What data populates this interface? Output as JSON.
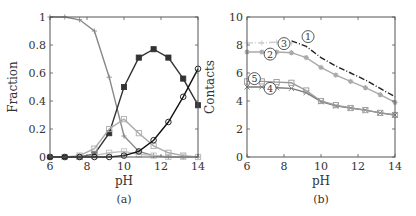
{
  "chart_data": [
    {
      "panel": "(a)",
      "type": "line",
      "xlabel": "pH",
      "ylabel": "Fraction",
      "xlim": [
        6,
        14
      ],
      "ylim": [
        0,
        1
      ],
      "xticks": [
        6,
        8,
        10,
        12,
        14
      ],
      "yticks": [
        0,
        0.2,
        0.4,
        0.6,
        0.8,
        1
      ],
      "ytick_labels": [
        "0",
        "0.2",
        "0.4",
        "0.6",
        "0.8",
        "1"
      ],
      "grid": false,
      "x": [
        6,
        6.8,
        7.6,
        8.4,
        9.2,
        10,
        10.8,
        11.6,
        12.4,
        13.2,
        14
      ],
      "series": [
        {
          "name": "plus-gray",
          "color": "#888888",
          "marker": "+",
          "values": [
            1.0,
            1.0,
            0.98,
            0.9,
            0.57,
            0.15,
            0.04,
            0.01,
            0.0,
            0.0,
            0.0
          ]
        },
        {
          "name": "filled-square-dark",
          "color": "#333333",
          "marker": "filled-square",
          "values": [
            0.0,
            0.0,
            0.0,
            0.02,
            0.17,
            0.5,
            0.71,
            0.77,
            0.71,
            0.56,
            0.37
          ]
        },
        {
          "name": "open-square-light",
          "color": "#aaaaaa",
          "marker": "open-square",
          "values": [
            0.0,
            0.0,
            0.01,
            0.06,
            0.2,
            0.27,
            0.17,
            0.08,
            0.03,
            0.01,
            0.0
          ]
        },
        {
          "name": "open-square-pale",
          "color": "#c0c0c0",
          "marker": "open-square",
          "values": [
            0.0,
            0.0,
            0.0,
            0.01,
            0.03,
            0.04,
            0.02,
            0.01,
            0.0,
            0.0,
            0.0
          ]
        },
        {
          "name": "circle-black",
          "color": "#111111",
          "marker": "open-circle",
          "values": [
            0.0,
            0.0,
            0.0,
            0.0,
            0.0,
            0.01,
            0.04,
            0.12,
            0.25,
            0.43,
            0.63
          ]
        }
      ]
    },
    {
      "panel": "(b)",
      "type": "line",
      "xlabel": "pH",
      "ylabel": "Contacts",
      "xlim": [
        6,
        14
      ],
      "ylim": [
        0,
        10
      ],
      "xticks": [
        6,
        8,
        10,
        12,
        14
      ],
      "yticks": [
        0,
        2,
        4,
        6,
        8,
        10
      ],
      "grid": false,
      "x": [
        6,
        6.8,
        7.6,
        8.4,
        9.2,
        10,
        10.8,
        11.6,
        12.4,
        13.2,
        14
      ],
      "series": [
        {
          "name": "1",
          "color": "#222222",
          "marker": "none",
          "dashed": true,
          "values": [
            null,
            null,
            null,
            8.3,
            7.9,
            7.1,
            6.5,
            6.0,
            5.5,
            4.9,
            4.3
          ]
        },
        {
          "name": "2",
          "color": "#aaaaaa",
          "marker": "star",
          "values": [
            7.5,
            7.5,
            7.5,
            7.45,
            7.1,
            6.4,
            5.85,
            5.4,
            4.95,
            4.45,
            3.9
          ]
        },
        {
          "name": "3",
          "color": "#cccccc",
          "marker": "plus",
          "dashed": true,
          "values": [
            8.15,
            8.15,
            8.2,
            8.15,
            null,
            null,
            null,
            null,
            null,
            null,
            null
          ]
        },
        {
          "name": "4",
          "color": "#777777",
          "marker": "x",
          "values": [
            5.0,
            5.0,
            4.95,
            4.9,
            4.6,
            3.95,
            3.65,
            3.5,
            3.35,
            3.15,
            3.0
          ]
        },
        {
          "name": "5",
          "color": "#999999",
          "marker": "open-square",
          "values": [
            5.4,
            5.4,
            5.35,
            5.3,
            4.75,
            4.0,
            3.7,
            3.5,
            3.35,
            3.15,
            3.0
          ]
        }
      ],
      "annotations": [
        {
          "label": "1",
          "x": 9.3,
          "y": 8.6
        },
        {
          "label": "2",
          "x": 7.25,
          "y": 7.35
        },
        {
          "label": "3",
          "x": 8.0,
          "y": 8.1
        },
        {
          "label": "4",
          "x": 7.25,
          "y": 4.9
        },
        {
          "label": "5",
          "x": 6.4,
          "y": 5.6
        }
      ]
    }
  ],
  "captions": {
    "a": "(a)",
    "b": "(b)"
  }
}
